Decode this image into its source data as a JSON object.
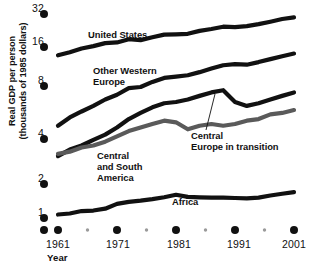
{
  "chart_data": {
    "type": "line",
    "title": "",
    "subtitle": "",
    "xlabel": "Year",
    "ylabel": "Real GDP per person (thousands of 1985 dollars)",
    "ylabel_line1": "Real GDP per person",
    "ylabel_line2": "(thousands of 1985 dollars)",
    "yscale": "log2",
    "ylim": [
      0.8,
      32
    ],
    "xlim": [
      1960,
      2002
    ],
    "grid": false,
    "legend_position": "inline-annotations",
    "ytick_labels": [
      "32",
      "16",
      "8",
      "4",
      "2",
      "1"
    ],
    "ytick_values": [
      32,
      16,
      8,
      4,
      2,
      1
    ],
    "xtick_labels": [
      "1961",
      "1971",
      "1981",
      "1991",
      "2001"
    ],
    "xtick_values": [
      1961,
      1971,
      1981,
      1991,
      2001
    ],
    "xtick_minor_values": [
      1966,
      1976,
      1986,
      1996
    ],
    "series": [
      {
        "name": "United States",
        "color": "#111111",
        "x": [
          1961,
          1963,
          1965,
          1967,
          1969,
          1971,
          1973,
          1975,
          1977,
          1979,
          1981,
          1983,
          1985,
          1987,
          1989,
          1991,
          1993,
          1995,
          1997,
          1999,
          2001
        ],
        "values": [
          12.4,
          13.1,
          14.0,
          14.6,
          15.4,
          15.6,
          16.6,
          16.3,
          17.3,
          18.3,
          18.4,
          18.6,
          19.8,
          20.6,
          21.6,
          21.4,
          21.9,
          22.8,
          24.0,
          25.4,
          26.3
        ]
      },
      {
        "name": "Other Western Europe",
        "color": "#111111",
        "x": [
          1961,
          1963,
          1965,
          1967,
          1969,
          1971,
          1973,
          1975,
          1977,
          1979,
          1981,
          1983,
          1985,
          1987,
          1989,
          1991,
          1993,
          1995,
          1997,
          1999,
          2001
        ],
        "values": [
          4.4,
          4.9,
          5.3,
          5.7,
          6.2,
          6.6,
          7.2,
          7.3,
          7.8,
          8.3,
          8.5,
          8.7,
          9.2,
          9.8,
          10.4,
          10.6,
          10.5,
          11.0,
          11.6,
          12.2,
          12.8
        ]
      },
      {
        "name": "Central Europe in transition",
        "color": "#111111",
        "x": [
          1961,
          1963,
          1965,
          1967,
          1969,
          1971,
          1973,
          1975,
          1977,
          1979,
          1981,
          1983,
          1985,
          1987,
          1989,
          1991,
          1993,
          1995,
          1997,
          1999,
          2001
        ],
        "values": [
          2.8,
          3.1,
          3.3,
          3.6,
          3.9,
          4.3,
          4.8,
          5.2,
          5.6,
          5.9,
          6.0,
          6.2,
          6.5,
          6.8,
          7.0,
          6.0,
          5.7,
          5.9,
          6.2,
          6.5,
          6.8
        ]
      },
      {
        "name": "Central and South America",
        "color": "#5a5a5a",
        "x": [
          1961,
          1963,
          1965,
          1967,
          1969,
          1971,
          1973,
          1975,
          1977,
          1979,
          1981,
          1983,
          1985,
          1987,
          1989,
          1991,
          1993,
          1995,
          1997,
          1999,
          2001
        ],
        "values": [
          2.9,
          3.0,
          3.2,
          3.3,
          3.5,
          3.8,
          4.1,
          4.3,
          4.5,
          4.7,
          4.6,
          4.2,
          4.4,
          4.5,
          4.4,
          4.5,
          4.7,
          4.8,
          5.1,
          5.2,
          5.4
        ]
      },
      {
        "name": "Africa",
        "color": "#111111",
        "x": [
          1961,
          1963,
          1965,
          1967,
          1969,
          1971,
          1973,
          1975,
          1977,
          1979,
          1981,
          1983,
          1985,
          1987,
          1989,
          1991,
          1993,
          1995,
          1997,
          1999,
          2001
        ],
        "values": [
          0.95,
          0.97,
          1.02,
          1.03,
          1.07,
          1.18,
          1.23,
          1.26,
          1.3,
          1.35,
          1.42,
          1.36,
          1.35,
          1.34,
          1.34,
          1.33,
          1.32,
          1.34,
          1.4,
          1.45,
          1.5
        ]
      }
    ],
    "annotations": [
      {
        "name": "United States",
        "text": "United States"
      },
      {
        "name": "Other Western Europe",
        "text_line1": "Other Western",
        "text_line2": "Europe"
      },
      {
        "name": "Central and South America",
        "text_line1": "Central",
        "text_line2": "and South",
        "text_line3": "America"
      },
      {
        "name": "Central Europe in transition",
        "text_line1": "Central",
        "text_line2": "Europe in transition"
      },
      {
        "name": "Africa",
        "text": "Africa"
      }
    ]
  },
  "axes": {
    "y_label_line1": "Real GDP per person",
    "y_label_line2": "(thousands of 1985 dollars)",
    "x_caption": "Year",
    "y_ticks": [
      "32",
      "16",
      "8",
      "4",
      "2",
      "1"
    ],
    "x_ticks": [
      "1961",
      "1971",
      "1981",
      "1991",
      "2001"
    ]
  },
  "labels": {
    "united_states": "United States",
    "other_western": "Other Western",
    "europe": "Europe",
    "central": "Central",
    "and_south": "and South",
    "america": "America",
    "central2": "Central",
    "europe_in_transition": "Europe in transition",
    "africa": "Africa"
  }
}
